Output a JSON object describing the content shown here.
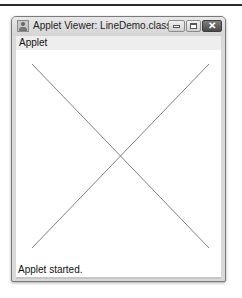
{
  "window": {
    "title": "Applet Viewer: LineDemo.class",
    "icons": {
      "app": "java-applet-icon",
      "minimize": "minimize-icon",
      "maximize": "maximize-icon",
      "close": "close-icon"
    },
    "close_glyph": "✕"
  },
  "menubar": {
    "items": [
      {
        "label": "Applet"
      }
    ]
  },
  "canvas": {
    "background": "#ffffff",
    "line_color": "#808080",
    "lines": [
      {
        "x1": 16,
        "y1": 14,
        "x2": 193,
        "y2": 198
      },
      {
        "x1": 193,
        "y1": 14,
        "x2": 16,
        "y2": 198
      }
    ]
  },
  "status": {
    "text": "Applet started."
  }
}
